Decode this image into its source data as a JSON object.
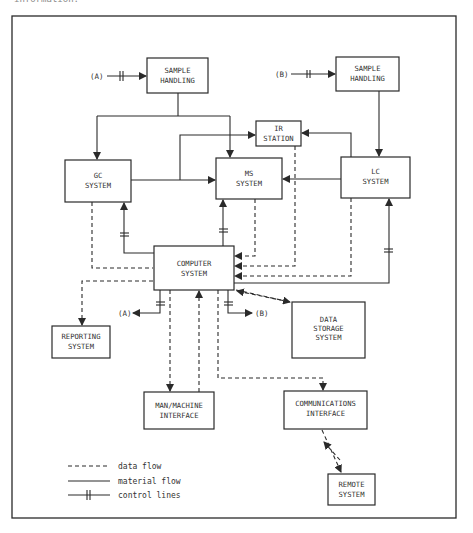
{
  "caption": "information.",
  "diagram": {
    "nodes": {
      "sample_a": {
        "line1": "SAMPLE",
        "line2": "HANDLING"
      },
      "sample_b": {
        "line1": "SAMPLE",
        "line2": "HANDLING"
      },
      "ir": {
        "line1": "IR",
        "line2": "STATION"
      },
      "gc": {
        "line1": "GC",
        "line2": "SYSTEM"
      },
      "ms": {
        "line1": "MS",
        "line2": "SYSTEM"
      },
      "lc": {
        "line1": "LC",
        "line2": "SYSTEM"
      },
      "computer": {
        "line1": "COMPUTER",
        "line2": "SYSTEM"
      },
      "reporting": {
        "line1": "REPORTING",
        "line2": "SYSTEM"
      },
      "storage": {
        "line1": "DATA",
        "line2": "STORAGE",
        "line3": "SYSTEM"
      },
      "manmachine": {
        "line1": "MAN/MACHINE",
        "line2": "INTERFACE"
      },
      "comms": {
        "line1": "COMMUNICATIONS",
        "line2": "INTERFACE"
      },
      "remote": {
        "line1": "REMOTE",
        "line2": "SYSTEM"
      }
    },
    "inputs": {
      "a_in": "(A)",
      "b_in": "(B)",
      "a_out": "(A)",
      "b_out": "(B)"
    },
    "legend": {
      "data_flow": "data flow",
      "material_flow": "material flow",
      "control_lines": "control lines"
    }
  }
}
